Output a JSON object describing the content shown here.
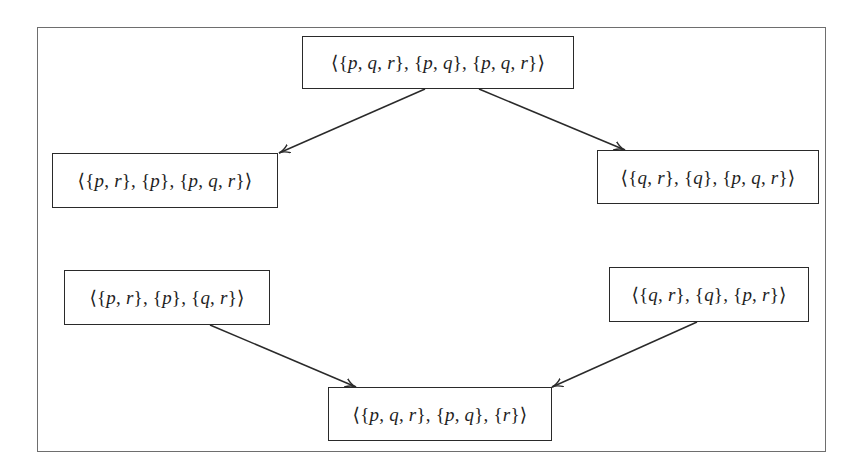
{
  "diagram": {
    "type": "lattice-graph",
    "nodes": [
      {
        "id": "top",
        "label": "⟨{p, q, r}, {p, q}, {p, q, r}⟩",
        "x": 302,
        "y": 36,
        "w": 272,
        "h": 53
      },
      {
        "id": "mid-left",
        "label": "⟨{p, r}, {p}, {p, q, r}⟩",
        "x": 52,
        "y": 153,
        "w": 226,
        "h": 55
      },
      {
        "id": "mid-right",
        "label": "⟨{q, r}, {q}, {p, q, r}⟩",
        "x": 597,
        "y": 150,
        "w": 222,
        "h": 54
      },
      {
        "id": "low-left",
        "label": "⟨{p, r}, {p}, {q, r}⟩",
        "x": 64,
        "y": 270,
        "w": 206,
        "h": 55
      },
      {
        "id": "low-right",
        "label": "⟨{q, r}, {q}, {p, r}⟩",
        "x": 609,
        "y": 267,
        "w": 200,
        "h": 55
      },
      {
        "id": "bottom",
        "label": "⟨{p, q, r}, {p, q}, {r}⟩",
        "x": 328,
        "y": 387,
        "w": 224,
        "h": 54
      }
    ],
    "edges": [
      {
        "from": "top",
        "to": "mid-left",
        "x1": 425,
        "y1": 89,
        "x2": 279,
        "y2": 153
      },
      {
        "from": "top",
        "to": "mid-right",
        "x1": 479,
        "y1": 89,
        "x2": 625,
        "y2": 150
      },
      {
        "from": "low-left",
        "to": "bottom",
        "x1": 210,
        "y1": 325,
        "x2": 356,
        "y2": 387
      },
      {
        "from": "low-right",
        "to": "bottom",
        "x1": 697,
        "y1": 322,
        "x2": 552,
        "y2": 387
      }
    ],
    "colors": {
      "frame": "#6e6e6e",
      "node_border": "#2a2a2a",
      "edge": "#2a2a2a",
      "text": "#1e1e1e"
    }
  }
}
